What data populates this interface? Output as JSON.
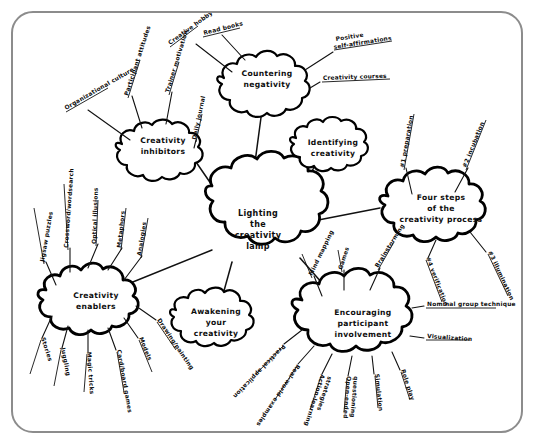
{
  "diagram": {
    "type": "mind-map",
    "title_node": "Lighting the creativity lamp",
    "frame_color": "#8c8c8c",
    "ink_color": "#111111",
    "background": "#ffffff"
  },
  "center": {
    "label_lines": [
      "Lighting",
      "the",
      "creativity",
      "lamp"
    ],
    "line1": "Lighting",
    "line2": "the",
    "line3": "creativity",
    "line4": "lamp"
  },
  "nodes": [
    {
      "id": "countering-negativity",
      "line1": "Countering",
      "line2": "negativity",
      "branches": [
        "Creative hobby",
        "Read books",
        "Positive self-affirmations",
        "Creativity courses"
      ]
    },
    {
      "id": "creativity-inhibitors",
      "line1": "Creativity",
      "line2": "inhibitors",
      "branches": [
        "Organizational culture",
        "Participant attitudes",
        "Trainer motivation",
        "Daily journal"
      ]
    },
    {
      "id": "identifying-creativity",
      "line1": "Identifying",
      "line2": "creativity",
      "branches": []
    },
    {
      "id": "four-steps",
      "line1": "Four steps",
      "line2": "of the",
      "line3": "creativity process",
      "branches": [
        "#1 preparation",
        "#2 incubation",
        "#3 illumination",
        "#4 verification"
      ]
    },
    {
      "id": "creativity-enablers",
      "line1": "Creativity",
      "line2": "enablers",
      "branches": [
        "Jigsaw puzzles",
        "Crossword/wordsearch",
        "Optical illusions",
        "Metaphors",
        "Analogies",
        "Stories",
        "Juggling",
        "Magic tricks",
        "Card/board games",
        "Models",
        "Drawing/painting"
      ]
    },
    {
      "id": "awakening-your-creativity",
      "line1": "Awakening",
      "line2": "your",
      "line3": "creativity",
      "branches": []
    },
    {
      "id": "encouraging-participant-involvement",
      "line1": "Encouraging",
      "line2": "participant",
      "line3": "involvement",
      "branches": [
        "Mind mapping",
        "Games",
        "Brainstorming",
        "Nominal group technique",
        "Visualization",
        "Role play",
        "Simulation",
        "Open-ended questioning",
        "Action-learning strategies",
        "Real-world examples",
        "Practical application"
      ]
    }
  ],
  "labels": {
    "creative_hobby": "Creative hobby",
    "read_books": "Read books",
    "positive_self_1": "Positive",
    "positive_self_2": "self-affirmations",
    "creativity_courses": "Creativity courses",
    "organizational_culture": "Organizational culture",
    "participant_attitudes": "Participant attitudes",
    "trainer_motivation": "Trainer motivation",
    "daily_journal": "Daily journal",
    "step1": "#1 preparation",
    "step2": "#2 incubation",
    "step3": "#3 illumination",
    "step4": "#4 verification",
    "jigsaw_puzzles": "Jigsaw puzzles",
    "crossword": "Crossword/wordsearch",
    "optical_illusions": "Optical illusions",
    "metaphors": "Metaphors",
    "analogies": "Analogies",
    "stories": "Stories",
    "juggling": "Juggling",
    "magic_tricks": "Magic tricks",
    "card_board_games": "Card/board games",
    "models": "Models",
    "drawing_painting": "Drawing/painting",
    "mind_mapping": "Mind mapping",
    "games": "Games",
    "brainstorming": "Brainstorming",
    "nominal_group": "Nominal group technique",
    "visualization": "Visualization",
    "role_play": "Role play",
    "simulation": "Simulation",
    "open_ended_1": "Open-ended",
    "open_ended_2": "questioning",
    "action_learning_1": "Action-learning",
    "action_learning_2": "strategies",
    "real_world": "Real-world examples",
    "practical_application": "Practical application"
  }
}
